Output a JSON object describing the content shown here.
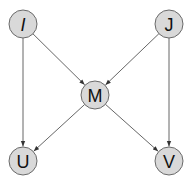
{
  "diagram": {
    "type": "directed-graph",
    "node_fill": "#d9d9d9",
    "node_stroke": "#6a6a6a",
    "edge_color": "#555555",
    "nodes": [
      {
        "id": "I",
        "label": "I",
        "italic": true
      },
      {
        "id": "J",
        "label": "J",
        "italic": false
      },
      {
        "id": "M",
        "label": "M",
        "italic": false
      },
      {
        "id": "U",
        "label": "U",
        "italic": false
      },
      {
        "id": "V",
        "label": "V",
        "italic": false
      }
    ],
    "edges": [
      {
        "from": "I",
        "to": "M"
      },
      {
        "from": "J",
        "to": "M"
      },
      {
        "from": "I",
        "to": "U"
      },
      {
        "from": "J",
        "to": "V"
      },
      {
        "from": "M",
        "to": "U"
      },
      {
        "from": "M",
        "to": "V"
      }
    ]
  }
}
